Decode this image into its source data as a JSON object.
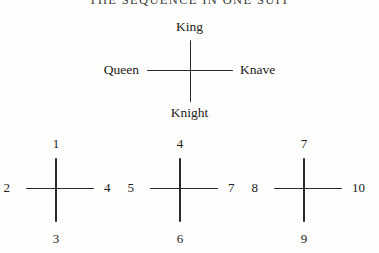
{
  "figure": {
    "title": "THE SEQUENCE IN ONE SUIT",
    "ink_color": "#2a2927",
    "background_color": "#fdfdfb"
  },
  "court_cross": {
    "name": "court-card-cross",
    "top": "King",
    "left": "Queen",
    "right": "Knave",
    "bottom": "Knight"
  },
  "number_crosses": [
    {
      "top": "1",
      "left": "2",
      "right": "4",
      "bottom": "3"
    },
    {
      "top": "4",
      "left": "5",
      "right": "7",
      "bottom": "6"
    },
    {
      "top": "7",
      "left": "8",
      "right": "10",
      "bottom": "9"
    }
  ]
}
